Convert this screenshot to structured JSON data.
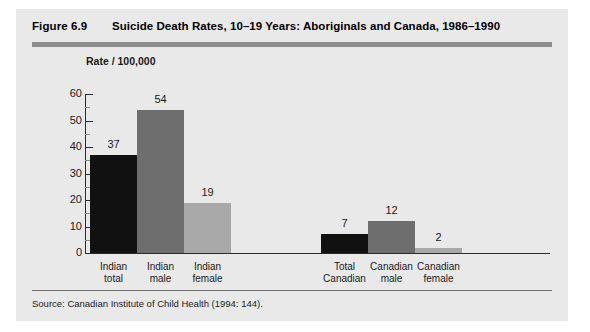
{
  "figure": {
    "number": "Figure 6.9",
    "title": "Suicide Death Rates, 10–19 Years: Aboriginals and Canada, 1986–1990",
    "source": "Source:  Canadian Institute of Child Health (1994: 144)."
  },
  "colors": {
    "page_background": "#ffffff",
    "panel_background": "#e9e9e9",
    "rule": "#8d8d8d",
    "axis": "#2b2b2b",
    "bar_dark": "#111111",
    "bar_medium": "#6e6e6e",
    "bar_light": "#a8a8a8"
  },
  "chart_data": {
    "type": "bar",
    "title": "Suicide Death Rates, 10–19 Years: Aboriginals and Canada, 1986–1990",
    "xlabel": "",
    "ylabel": "Rate / 100,000",
    "ylim": [
      0,
      60
    ],
    "yticks": [
      0,
      10,
      20,
      30,
      40,
      50,
      60
    ],
    "ytick_labels": [
      "0",
      "10",
      "20",
      "30",
      "40",
      "50",
      "60"
    ],
    "grid": false,
    "legend": "none",
    "categories": [
      "Indian total",
      "Indian male",
      "Indian female",
      "Total Canadian",
      "Canadian male",
      "Canadian female"
    ],
    "category_lines": [
      [
        "Indian",
        "total"
      ],
      [
        "Indian",
        "male"
      ],
      [
        "Indian",
        "female"
      ],
      [
        "Total",
        "Canadian"
      ],
      [
        "Canadian",
        "male"
      ],
      [
        "Canadian",
        "female"
      ]
    ],
    "values": [
      37,
      54,
      19,
      7,
      12,
      2
    ],
    "value_labels": [
      "37",
      "54",
      "19",
      "7",
      "12",
      "2"
    ],
    "bar_colors": [
      "#111111",
      "#6e6e6e",
      "#a8a8a8",
      "#111111",
      "#6e6e6e",
      "#a8a8a8"
    ],
    "groups": [
      {
        "name": "Aboriginals",
        "categories": [
          "Indian total",
          "Indian male",
          "Indian female"
        ]
      },
      {
        "name": "Canada",
        "categories": [
          "Total Canadian",
          "Canadian male",
          "Canadian female"
        ]
      }
    ]
  }
}
